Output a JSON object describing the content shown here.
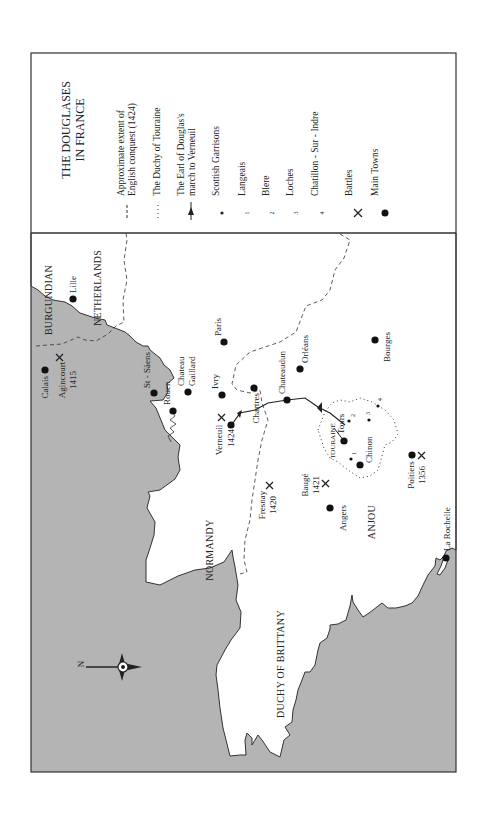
{
  "title": {
    "line1": "THE DOUGLASES",
    "line2": "IN FRANCE"
  },
  "colors": {
    "sea": "#b4b4b4",
    "land": "#ffffff",
    "ink": "#222222",
    "frame": "#333333"
  },
  "legend": {
    "items": [
      {
        "symbol": "dashed-line",
        "line1": "Approximate extent of",
        "line2": "English conquest (1424)"
      },
      {
        "symbol": "dotted-line",
        "line1": "The Duchy of Touraine"
      },
      {
        "symbol": "arrow-line",
        "line1": "The Earl of Douglas's",
        "line2": "march to Verneuil"
      },
      {
        "symbol": "small-dot",
        "line1": "Scottish Garrisons"
      },
      {
        "symbol": "1",
        "line1": "Langeais"
      },
      {
        "symbol": "2",
        "line1": "Blere"
      },
      {
        "symbol": "3",
        "line1": "Loches"
      },
      {
        "symbol": "4",
        "line1": "Chatillon - Sur - Indre"
      },
      {
        "symbol": "cross-swords",
        "line1": "Battles"
      },
      {
        "symbol": "large-dot",
        "line1": "Main Towns"
      }
    ]
  },
  "regions": {
    "burgundian": "BURGUNDIAN",
    "netherlands": "NETHERLANDS",
    "normandy": "NORMANDY",
    "brittany": "DUCHY OF BRITTANY",
    "anjou": "ANJOU",
    "touraine": "TOURAINE"
  },
  "towns": {
    "calais": "Calais",
    "lille": "Lille",
    "st_saens": "St - Säens",
    "rouen": "Rouen",
    "chateau_gaillard_1": "Chateau",
    "chateau_gaillard_2": "Gaillard",
    "ivry": "Ivry",
    "paris": "Paris",
    "chartres": "Chartres",
    "chateaudun": "Chateaudun",
    "orleans": "Orléans",
    "bourges": "Bourges",
    "tours": "Tours",
    "chinon": "Chinon",
    "angers": "Angers",
    "la_rochelle": "La Rochelle"
  },
  "battles": {
    "agincourt": {
      "name": "Agincourt",
      "year": "1415"
    },
    "verneuil": {
      "name": "Verneuil",
      "year": "1424"
    },
    "fresnay": {
      "name": "Fresnay",
      "year": "1420"
    },
    "bauge": {
      "name": "Baugé",
      "year": "1421"
    },
    "poitiers": {
      "name": "Poitiers",
      "year": "1356"
    }
  },
  "garrison_numbers": {
    "n1": "1",
    "n2": "2",
    "n3": "3",
    "n4": "4"
  },
  "compass": {
    "north_label": "N"
  }
}
